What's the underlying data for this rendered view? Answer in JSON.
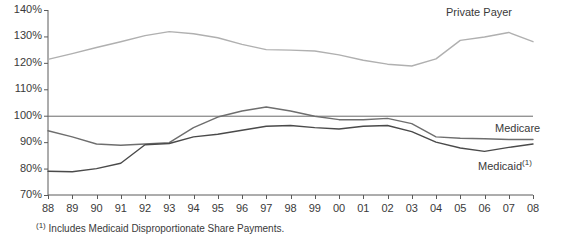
{
  "chart_data": {
    "type": "line",
    "title": "",
    "subtitle": "",
    "xlabel": "",
    "ylabel": "",
    "grid": false,
    "legend_position": "inline-right",
    "ylim": [
      70,
      140
    ],
    "y_ticks": [
      "70%",
      "80%",
      "90%",
      "100%",
      "110%",
      "120%",
      "130%",
      "140%"
    ],
    "y_tick_values": [
      70,
      80,
      90,
      100,
      110,
      120,
      130,
      140
    ],
    "reference_line": 100,
    "categories": [
      "88",
      "89",
      "90",
      "91",
      "92",
      "93",
      "94",
      "95",
      "96",
      "97",
      "98",
      "99",
      "00",
      "01",
      "02",
      "03",
      "04",
      "05",
      "06",
      "07",
      "08"
    ],
    "series": [
      {
        "name": "Private Payer",
        "color": "#b0b0b0",
        "label_x": 446,
        "label_y": 6,
        "values": [
          121.3,
          123.5,
          125.8,
          128.0,
          130.3,
          131.8,
          131.0,
          129.5,
          127.0,
          125.0,
          124.8,
          124.5,
          123.0,
          121.0,
          119.5,
          118.8,
          121.5,
          128.5,
          129.8,
          131.5,
          128.0
        ]
      },
      {
        "name": "Medicare",
        "color": "#6e6e6e",
        "label_x": 495,
        "label_y": 122,
        "values": [
          94.3,
          92.0,
          89.3,
          88.8,
          89.3,
          89.8,
          95.5,
          99.5,
          101.8,
          103.3,
          101.8,
          99.8,
          98.5,
          98.5,
          99.0,
          97.0,
          92.0,
          91.5,
          91.3,
          91.0,
          91.0
        ]
      },
      {
        "name": "Medicaid",
        "footnote_marker": "(1)",
        "color": "#4a4a4a",
        "label_x": 478,
        "label_y": 158,
        "values": [
          79.0,
          78.8,
          80.0,
          82.0,
          89.0,
          89.5,
          92.0,
          93.0,
          94.5,
          96.0,
          96.3,
          95.5,
          95.0,
          96.0,
          96.3,
          94.0,
          90.0,
          87.8,
          86.5,
          88.0,
          89.3
        ]
      }
    ],
    "footnote": "Includes Medicaid Disproportionate Share Payments.",
    "footnote_marker": "(1)"
  }
}
